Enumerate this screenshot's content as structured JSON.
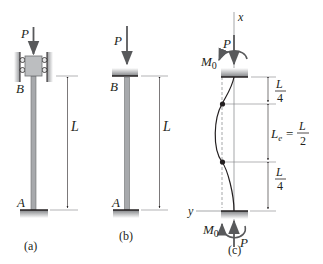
{
  "figure": {
    "panels": [
      {
        "id": "a",
        "caption": "(a)",
        "load_label": "P",
        "top_label": "B",
        "bottom_label": "A",
        "length_label": "L",
        "support_top": "roller-guided block",
        "support_bottom": "fixed"
      },
      {
        "id": "b",
        "caption": "(b)",
        "load_label": "P",
        "top_label": "B",
        "bottom_label": "A",
        "length_label": "L",
        "support_top": "fixed cap",
        "support_bottom": "fixed"
      },
      {
        "id": "c",
        "caption": "(c)",
        "axis_x_label": "x",
        "axis_y_label": "y",
        "top_load_label": "P",
        "bottom_load_label": "P",
        "top_moment_label": "M",
        "top_moment_sub": "0",
        "bottom_moment_label": "M",
        "bottom_moment_sub": "0",
        "dimensions": [
          {
            "num": "L",
            "den": "4"
          },
          {
            "lhs": "L",
            "lhs_sub": "e",
            "eq": "=",
            "num": "L",
            "den": "2"
          },
          {
            "num": "L",
            "den": "4"
          }
        ]
      }
    ],
    "colors": {
      "ink": "#231f20",
      "column": "#a7a9ac",
      "column_edge": "#6d6e71",
      "block": "#bcbec0",
      "wall": "#939598",
      "arrow": "#58595b",
      "dim_line": "#808285"
    }
  }
}
